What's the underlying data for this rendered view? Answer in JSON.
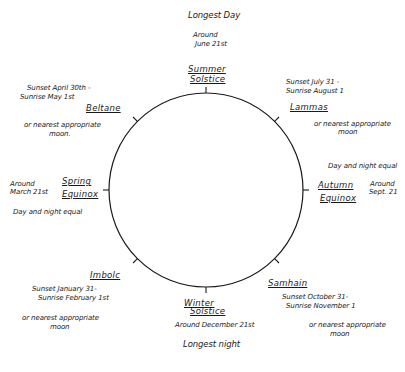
{
  "diagram": {
    "type": "wheel-of-the-year",
    "circle": {
      "cx": 206,
      "cy": 190,
      "r": 97,
      "stroke": "#1a1a1a"
    },
    "festivals": [
      {
        "id": "summer",
        "name_line1": "Summer",
        "name_line2": "Solstice",
        "notes": [
          "Longest Day",
          "Around",
          "June 21st"
        ]
      },
      {
        "id": "lammas",
        "name_line1": "Lammas",
        "notes": [
          "Sunset July 31 -",
          "Sunrise August 1",
          "or nearest appropriate",
          "moon"
        ]
      },
      {
        "id": "autumn",
        "name_line1": "Autumn",
        "name_line2": "Equinox",
        "notes": [
          "Day and night equal",
          "Around",
          "Sept. 21"
        ]
      },
      {
        "id": "samhain",
        "name_line1": "Samhain",
        "notes": [
          "Sunset October 31-",
          "Sunrise November 1",
          "or nearest appropriate",
          "moon"
        ]
      },
      {
        "id": "winter",
        "name_line1": "Winter",
        "name_line2": "Solstice",
        "notes": [
          "Around December 21st",
          "Longest night"
        ]
      },
      {
        "id": "imbolc",
        "name_line1": "Imbolc",
        "notes": [
          "Sunset January 31-",
          "Sunrise February 1st",
          "or nearest appropriate",
          "moon"
        ]
      },
      {
        "id": "spring",
        "name_line1": "Spring",
        "name_line2": "Equinox",
        "notes": [
          "Around",
          "March 21st",
          "Day and night equal"
        ]
      },
      {
        "id": "beltane",
        "name_line1": "Beltane",
        "notes": [
          "Sunset April 30th -",
          "Sunrise May 1st",
          "or nearest appropriate",
          "moon."
        ]
      }
    ]
  }
}
